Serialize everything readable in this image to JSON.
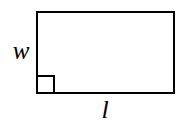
{
  "figure": {
    "kind": "geometry-diagram",
    "shape": "rectangle",
    "background_color": "#ffffff",
    "stroke_color": "#000000",
    "stroke_width": 2,
    "rectangle": {
      "x": 37,
      "y": 12,
      "width": 137,
      "height": 81
    },
    "right_angle_marker": {
      "corner": "bottom-left",
      "size": 17
    },
    "labels": {
      "width": "w",
      "length": "l"
    }
  }
}
